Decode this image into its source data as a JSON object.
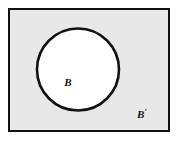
{
  "diagram": {
    "type": "venn-complement",
    "canvas": {
      "width": 179,
      "height": 142,
      "background": "#ffffff"
    },
    "universe": {
      "shape": "rectangle",
      "name": "universal-set",
      "x": 9,
      "y": 9,
      "width": 160,
      "height": 122,
      "fill": "#e8e8e8",
      "stroke": "#111111",
      "stroke_width": 2.2
    },
    "circle": {
      "shape": "circle",
      "name": "set-b",
      "cx": 78,
      "cy": 69.5,
      "r": 41,
      "fill": "#ffffff",
      "stroke": "#111111",
      "stroke_width": 2.6
    },
    "labels": [
      {
        "id": "label-b",
        "text": "B",
        "prime": "",
        "x": 68,
        "y": 86,
        "font_size": 11,
        "region": "inside-circle",
        "color": "#111111"
      },
      {
        "id": "label-b-complement",
        "text": "B",
        "prime": "′",
        "x": 142,
        "y": 118,
        "font_size": 11,
        "region": "outside-circle",
        "color": "#111111"
      }
    ]
  }
}
